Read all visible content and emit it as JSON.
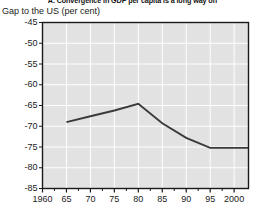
{
  "chart_data": {
    "type": "line",
    "title": "A. Convergence in GDP per capita is a long way off",
    "subtitle": "Gap to the US (per cent)",
    "xlabel": "",
    "ylabel": "",
    "ylim": [
      -85,
      -45
    ],
    "xlim": [
      1960,
      2003
    ],
    "grid": true,
    "legend": null,
    "yticks": [
      -45,
      -50,
      -55,
      -60,
      -65,
      -70,
      -75,
      -80,
      -85
    ],
    "ytick_labels": [
      "-45",
      "-50",
      "-55",
      "-60",
      "-65",
      "-70",
      "-75",
      "-80",
      "-85"
    ],
    "xticks": [
      1960,
      1965,
      1970,
      1975,
      1980,
      1985,
      1990,
      1995,
      2000
    ],
    "xtick_labels": [
      "1960",
      "65",
      "70",
      "75",
      "80",
      "85",
      "90",
      "95",
      "2000"
    ],
    "series": [
      {
        "name": "Gap to the US",
        "color": "#3a3a3a",
        "x": [
          1965,
          1970,
          1975,
          1980,
          1985,
          1990,
          1995,
          2000,
          2003
        ],
        "values": [
          -69.0,
          -67.6,
          -66.2,
          -64.6,
          -69.3,
          -72.8,
          -75.2,
          -75.2,
          -75.2
        ]
      }
    ]
  },
  "style": {
    "plot_background": "#e2e2e2",
    "gridline_color": "#ffffff",
    "frame_color": "#1a1a1a",
    "line_color": "#3a3a3a",
    "text_color": "#1a1a1a"
  }
}
